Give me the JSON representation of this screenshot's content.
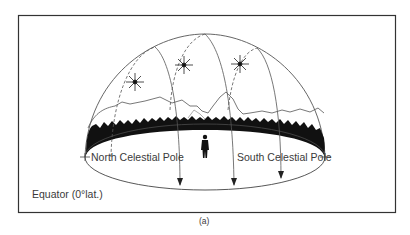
{
  "figure": {
    "caption": "(a)",
    "labels": {
      "north_pole": "North Celestial Pole",
      "south_pole": "South Celestial Pole",
      "equator": "Equator (0°lat.)"
    },
    "elements": {
      "dome": "celestial-hemisphere",
      "horizon": "ground-ellipse",
      "observer": "person-silhouette",
      "stars": [
        "star-left",
        "star-middle",
        "star-right"
      ],
      "star_paths": 3,
      "landscape": [
        "mountains",
        "tree-line"
      ]
    },
    "colors": {
      "line": "#555555",
      "fill_dark": "#111111",
      "text": "#3a3a3a",
      "background": "#ffffff"
    }
  }
}
